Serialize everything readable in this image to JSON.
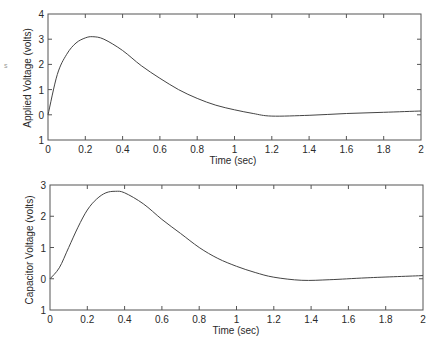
{
  "chart_data": [
    {
      "type": "line",
      "title": "",
      "xlabel": "Time (sec)",
      "ylabel": "Applied Voltage (volts)",
      "xlim": [
        0,
        2
      ],
      "ylim": [
        -1,
        4
      ],
      "x_ticks": [
        "0",
        "0.2",
        "0.4",
        "0.6",
        "0.8",
        "1",
        "1.2",
        "1.4",
        "1.6",
        "1.8",
        "2"
      ],
      "y_ticks": [
        "1",
        "0",
        "1",
        "2",
        "3",
        "4"
      ],
      "grid": false,
      "series": [
        {
          "name": "Applied Voltage",
          "x": [
            0,
            0.05,
            0.1,
            0.15,
            0.2,
            0.24,
            0.3,
            0.4,
            0.5,
            0.6,
            0.7,
            0.8,
            0.9,
            1.0,
            1.1,
            1.2,
            1.4,
            1.6,
            1.8,
            2.0
          ],
          "y": [
            0,
            1.6,
            2.4,
            2.85,
            3.05,
            3.1,
            3.0,
            2.55,
            1.95,
            1.45,
            1.0,
            0.65,
            0.38,
            0.2,
            0.05,
            -0.05,
            -0.02,
            0.05,
            0.1,
            0.15
          ]
        }
      ]
    },
    {
      "type": "line",
      "title": "",
      "xlabel": "Time (sec)",
      "ylabel": "Capacitor Voltage (volts)",
      "xlim": [
        0,
        2
      ],
      "ylim": [
        -1,
        3
      ],
      "x_ticks": [
        "0",
        "0.2",
        "0.4",
        "0.6",
        "0.8",
        "1",
        "1.2",
        "1.4",
        "1.6",
        "1.8",
        "2"
      ],
      "y_ticks": [
        "1",
        "0",
        "1",
        "2",
        "3"
      ],
      "grid": false,
      "series": [
        {
          "name": "Capacitor Voltage",
          "x": [
            0,
            0.05,
            0.1,
            0.15,
            0.2,
            0.25,
            0.3,
            0.35,
            0.4,
            0.5,
            0.6,
            0.7,
            0.8,
            0.9,
            1.0,
            1.1,
            1.2,
            1.35,
            1.5,
            1.7,
            2.0
          ],
          "y": [
            0,
            0.35,
            1.0,
            1.65,
            2.2,
            2.55,
            2.75,
            2.8,
            2.75,
            2.4,
            1.9,
            1.45,
            1.0,
            0.65,
            0.4,
            0.2,
            0.05,
            -0.05,
            -0.03,
            0.03,
            0.1
          ]
        }
      ]
    }
  ],
  "labels": {
    "top_ylabel": "Applied Voltage (volts)",
    "top_xlabel": "Time (sec)",
    "bottom_ylabel": "Capacitor Voltage (volts)",
    "bottom_xlabel": "Time (sec)"
  },
  "colors": {
    "line": "#444444",
    "frame": "#555555",
    "background": "#ffffff"
  }
}
